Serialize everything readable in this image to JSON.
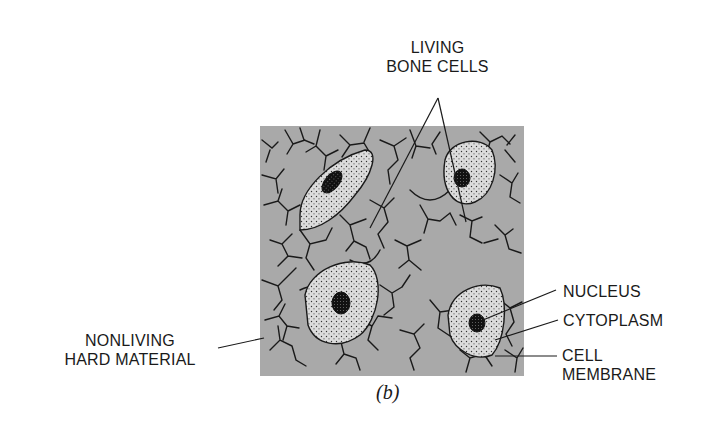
{
  "figure": {
    "caption": "(b)",
    "matrix_color": "#a9a9a9",
    "cytoplasm_color": "#d8d8d8",
    "line_color": "#1a1a1a"
  },
  "labels": {
    "living_bone_cells": [
      "LIVING",
      "BONE CELLS"
    ],
    "nonliving_hard_material": [
      "NONLIVING",
      "HARD MATERIAL"
    ],
    "nucleus": "NUCLEUS",
    "cytoplasm": "CYTOPLASM",
    "cell_membrane": [
      "CELL",
      "MEMBRANE"
    ]
  }
}
